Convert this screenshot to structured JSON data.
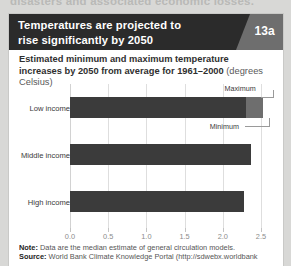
{
  "page": {
    "running_text": "disasters and associated economic losses."
  },
  "figure": {
    "badge": "13a",
    "title_line1": "Temperatures are projected to",
    "title_line2": "rise significantly by 2050",
    "subtitle_bold": "Estimated minimum and maximum temperature increases by 2050 from average for 1961–2000",
    "subtitle_unit": "(degrees Celsius)",
    "note_label": "Note:",
    "note_text": "Data are the median estimate of general circulation models.",
    "source_label": "Source:",
    "source_text": "World Bank Climate Knowledge Portal (http://sdwebx.worldbank"
  },
  "annotations": {
    "maximum": "Maximum",
    "minimum": "Minimum"
  },
  "colors": {
    "header_bg": "#2b2b2b",
    "badge_bg": "#6e6e6e",
    "bar_min": "#3b3b3b",
    "bar_max": "#6e6e6e",
    "grid": "#dedede"
  },
  "chart_data": {
    "type": "bar",
    "orientation": "horizontal",
    "title": "Temperatures are projected to rise significantly by 2050",
    "subtitle": "Estimated minimum and maximum temperature increases by 2050 from average for 1961–2000 (degrees Celsius)",
    "xlabel": "",
    "ylabel": "",
    "xlim": [
      0.0,
      2.5
    ],
    "ticks": [
      "0.0",
      "0.5",
      "1.0",
      "1.5",
      "2.0",
      "2.5"
    ],
    "tick_values": [
      0.0,
      0.5,
      1.0,
      1.5,
      2.0,
      2.5
    ],
    "grid": true,
    "legend": "inline-annotation",
    "categories": [
      "Low income",
      "Middle income",
      "High income"
    ],
    "series": [
      {
        "name": "Minimum",
        "values": [
          2.3,
          2.37,
          2.28
        ]
      },
      {
        "name": "Maximum",
        "values": [
          2.52,
          2.37,
          2.28
        ]
      }
    ]
  }
}
